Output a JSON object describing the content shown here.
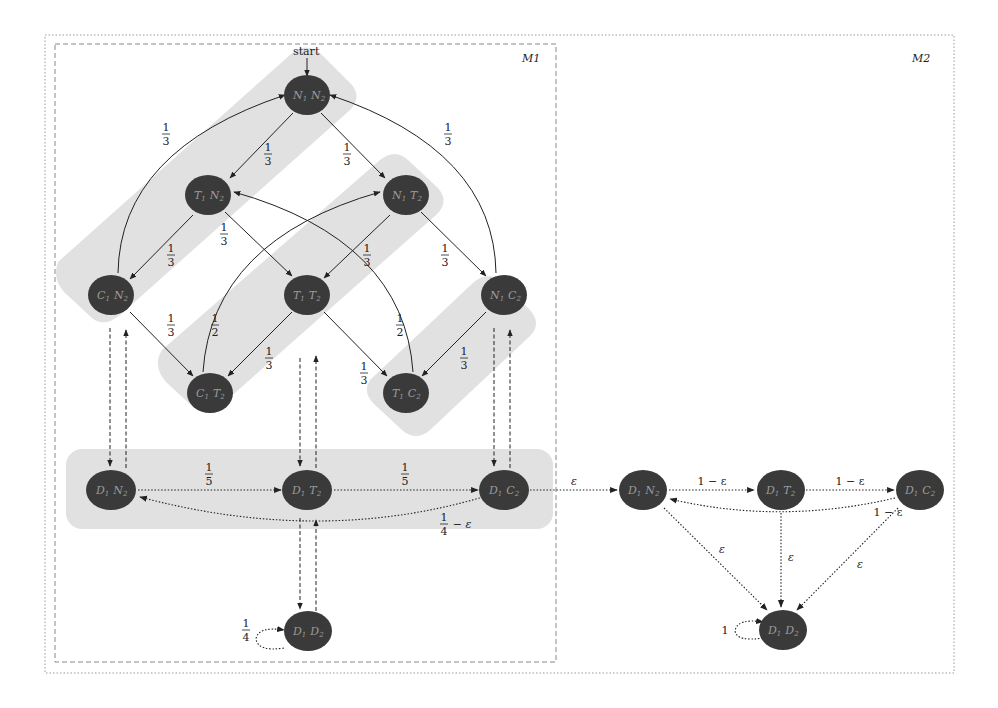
{
  "diagram": {
    "boxes": {
      "outer": {
        "label": "M2"
      },
      "m1": {
        "label": "M1"
      }
    },
    "start_label": "start",
    "colors": {
      "node_fill": "#3a3a3a",
      "node_label": "#a0a0a0",
      "band_fill": "#dedede",
      "edge": "#222222"
    },
    "nodes": {
      "N1N2": {
        "a": "N",
        "a_sub": "1",
        "b": "N",
        "b_sub": "2"
      },
      "T1N2": {
        "a": "T",
        "a_sub": "1",
        "b": "N",
        "b_sub": "2"
      },
      "N1T2": {
        "a": "N",
        "a_sub": "1",
        "b": "T",
        "b_sub": "2"
      },
      "C1N2": {
        "a": "C",
        "a_sub": "1",
        "b": "N",
        "b_sub": "2"
      },
      "T1T2": {
        "a": "T",
        "a_sub": "1",
        "b": "T",
        "b_sub": "2"
      },
      "N1C2": {
        "a": "N",
        "a_sub": "1",
        "b": "C",
        "b_sub": "2"
      },
      "C1T2": {
        "a": "C",
        "a_sub": "1",
        "b": "T",
        "b_sub": "2"
      },
      "T1C2": {
        "a": "T",
        "a_sub": "1",
        "b": "C",
        "b_sub": "2"
      },
      "D1N2": {
        "a": "D",
        "a_sub": "1",
        "b": "N",
        "b_sub": "2"
      },
      "D1T2": {
        "a": "D",
        "a_sub": "1",
        "b": "T",
        "b_sub": "2"
      },
      "D1C2": {
        "a": "D",
        "a_sub": "1",
        "b": "C",
        "b_sub": "2"
      },
      "D1D2": {
        "a": "D",
        "a_sub": "1",
        "b": "D",
        "b_sub": "2"
      },
      "M2_D1N2": {
        "a": "D",
        "a_sub": "1",
        "b": "N",
        "b_sub": "2"
      },
      "M2_D1T2": {
        "a": "D",
        "a_sub": "1",
        "b": "T",
        "b_sub": "2"
      },
      "M2_D1C2": {
        "a": "D",
        "a_sub": "1",
        "b": "C",
        "b_sub": "2"
      },
      "M2_D1D2": {
        "a": "D",
        "a_sub": "1",
        "b": "D",
        "b_sub": "2"
      }
    },
    "edges": {
      "N1N2_T1N2": {
        "num": "1",
        "den": "3"
      },
      "N1N2_N1T2": {
        "num": "1",
        "den": "3"
      },
      "C1N2_N1N2": {
        "num": "1",
        "den": "3"
      },
      "N1C2_N1N2": {
        "num": "1",
        "den": "3"
      },
      "T1N2_C1N2": {
        "num": "1",
        "den": "3"
      },
      "T1N2_T1T2": {
        "num": "1",
        "den": "3"
      },
      "N1T2_T1T2": {
        "num": "1",
        "den": "3"
      },
      "N1T2_N1C2": {
        "num": "1",
        "den": "3"
      },
      "C1N2_C1T2": {
        "num": "1",
        "den": "3"
      },
      "C1T2_N1T2": {
        "num": "1",
        "den": "2"
      },
      "T1T2_C1T2": {
        "num": "1",
        "den": "3"
      },
      "T1T2_T1C2": {
        "num": "1",
        "den": "3"
      },
      "T1C2_T1N2": {
        "num": "1",
        "den": "2"
      },
      "N1C2_T1C2": {
        "num": "1",
        "den": "3"
      },
      "D1N2_D1T2": {
        "num": "1",
        "den": "5"
      },
      "D1T2_D1C2": {
        "num": "1",
        "den": "5"
      },
      "D1C2_D1N2": {
        "num": "1",
        "den": "4",
        "suffix": "− ε"
      },
      "D1D2_self": {
        "num": "1",
        "den": "4"
      },
      "D1C2_M2D1N2": {
        "label": "ε"
      },
      "M2_N_T": {
        "label": "1 − ε"
      },
      "M2_T_C": {
        "label": "1 − ε"
      },
      "M2_C_N": {
        "label": "1 − ε"
      },
      "M2_N_D": {
        "label": "ε"
      },
      "M2_T_D": {
        "label": "ε"
      },
      "M2_C_D": {
        "label": "ε"
      },
      "M2_D_self": {
        "label": "1"
      }
    }
  }
}
